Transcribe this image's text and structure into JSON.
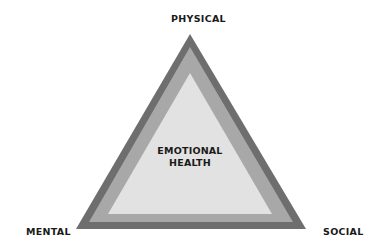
{
  "diagram": {
    "type": "triangle",
    "vertices": {
      "top": "PHYSICAL",
      "bottom_left": "MENTAL",
      "bottom_right": "SOCIAL"
    },
    "center": {
      "line1": "EMOTIONAL",
      "line2": "HEALTH"
    },
    "colors": {
      "outer_border": "#6e6e6e",
      "middle_band": "#a8a8a8",
      "inner_fill": "#e2e2e2",
      "text": "#1a1a1a",
      "background": "#ffffff"
    }
  }
}
